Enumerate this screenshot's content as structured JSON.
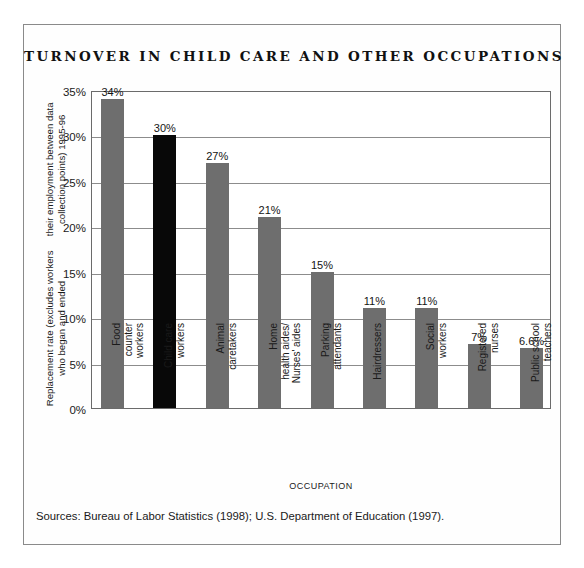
{
  "figure": {
    "title": "TURNOVER IN CHILD CARE AND OTHER OCCUPATIONS",
    "sources": "Sources: Bureau of Labor Statistics (1998); U.S. Department of Education (1997).",
    "border_color": "#8a8a8a"
  },
  "chart_data": {
    "type": "bar",
    "title": "TURNOVER IN CHILD CARE AND OTHER OCCUPATIONS",
    "xlabel": "OCCUPATION",
    "ylabel": "Replacement rate (excludes workers who began and ended their employment between data collection points) 1995-96",
    "ylabel_lines": [
      "Replacement rate (excludes workers who began and ended",
      "their employment between data collection points) 1995-96"
    ],
    "ylim": [
      0,
      35
    ],
    "ytick_values": [
      0,
      5,
      10,
      15,
      20,
      25,
      30,
      35
    ],
    "ytick_labels": [
      "0%",
      "5%",
      "10%",
      "15%",
      "20%",
      "25%",
      "30%",
      "35%"
    ],
    "grid": true,
    "legend": false,
    "bar_color": "#6e6e6e",
    "highlight_color": "#080808",
    "categories": [
      "Food counter workers",
      "Child care workers",
      "Animal caretakers",
      "Home health aides/ Nurses' aides",
      "Parking attendants",
      "Hairdressers",
      "Social workers",
      "Registered nurses",
      "Public school teachers"
    ],
    "category_label_lines": [
      "Food\ncounter\nworkers",
      "Child care\nworkers",
      "Animal\ncaretakers",
      "Home\nhealth aides/\nNurses' aides",
      "Parking\nattendants",
      "Hairdressers",
      "Social\nworkers",
      "Registered\nnurses",
      "Public school\nteachers"
    ],
    "values": [
      34,
      30,
      27,
      21,
      15,
      11,
      11,
      7,
      6.6
    ],
    "value_labels": [
      "34%",
      "30%",
      "27%",
      "21%",
      "15%",
      "11%",
      "11%",
      "7%",
      "6.6%"
    ],
    "highlighted_index": 1
  }
}
